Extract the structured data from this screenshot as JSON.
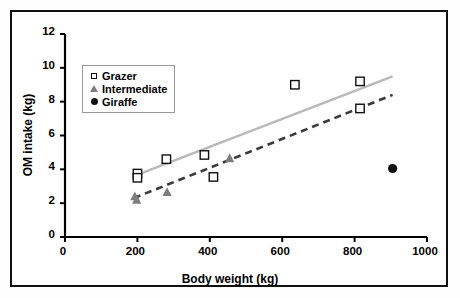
{
  "chart_data": {
    "type": "scatter",
    "title": "",
    "xlabel": "Body weight (kg)",
    "ylabel": "OM intake (kg)",
    "xlim": [
      0,
      1000
    ],
    "ylim": [
      0,
      12
    ],
    "xticks": [
      0,
      200,
      400,
      600,
      800,
      1000
    ],
    "yticks": [
      0,
      2,
      4,
      6,
      8,
      10,
      12
    ],
    "grid": false,
    "legend_position": "upper-left",
    "series": [
      {
        "name": "Grazer",
        "marker": "open-square",
        "color": "#111111",
        "points": [
          {
            "x": 200,
            "y": 3.75
          },
          {
            "x": 200,
            "y": 3.5
          },
          {
            "x": 280,
            "y": 4.6
          },
          {
            "x": 385,
            "y": 4.85
          },
          {
            "x": 410,
            "y": 3.55
          },
          {
            "x": 635,
            "y": 9.0
          },
          {
            "x": 815,
            "y": 9.2
          },
          {
            "x": 815,
            "y": 7.6
          }
        ],
        "trendline": {
          "style": "solid",
          "color": "#b9b9b9",
          "x0": 190,
          "y0": 3.6,
          "x1": 905,
          "y1": 9.5
        }
      },
      {
        "name": "Intermediate",
        "marker": "filled-triangle",
        "color": "#7d7d7d",
        "points": [
          {
            "x": 193,
            "y": 2.4
          },
          {
            "x": 198,
            "y": 2.2
          },
          {
            "x": 282,
            "y": 2.65
          },
          {
            "x": 455,
            "y": 4.65
          }
        ],
        "trendline": {
          "style": "dashed",
          "color": "#3a3a3a",
          "x0": 190,
          "y0": 2.3,
          "x1": 905,
          "y1": 8.4
        }
      },
      {
        "name": "Giraffe",
        "marker": "filled-circle",
        "color": "#111111",
        "points": [
          {
            "x": 905,
            "y": 4.05
          }
        ],
        "trendline": null
      }
    ]
  },
  "axes": {
    "x_title": "Body weight (kg)",
    "y_title": "OM intake (kg)",
    "x_tick_labels": [
      "0",
      "200",
      "400",
      "600",
      "800",
      "1000"
    ],
    "y_tick_labels": [
      "0",
      "2",
      "4",
      "6",
      "8",
      "10",
      "12"
    ]
  },
  "legend": {
    "entries": [
      {
        "label": "Grazer",
        "marker": "open-square-icon"
      },
      {
        "label": "Intermediate",
        "marker": "filled-triangle-icon"
      },
      {
        "label": "Giraffe",
        "marker": "filled-circle-icon"
      }
    ]
  },
  "colors": {
    "grazer_trend": "#b9b9b9",
    "intermediate_trend": "#3a3a3a",
    "intermediate_marker": "#7d7d7d",
    "axis": "#000000",
    "frame": "#111111"
  }
}
